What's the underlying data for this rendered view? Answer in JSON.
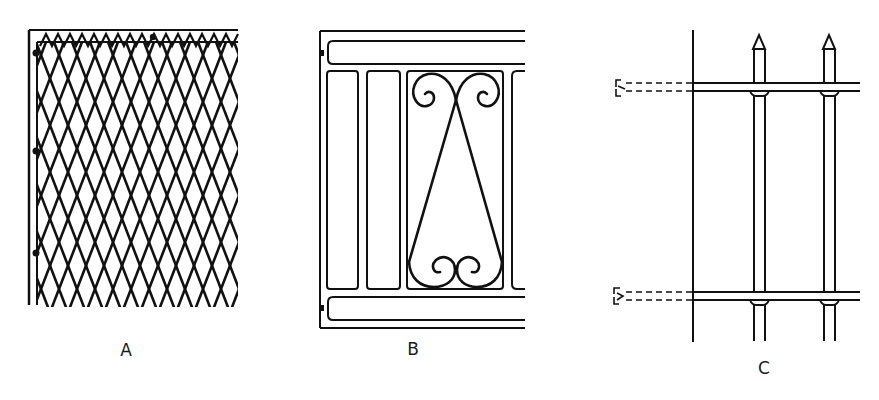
{
  "figure": {
    "panels": [
      {
        "id": "A",
        "label": "A",
        "subject": "diamond-mesh-fence"
      },
      {
        "id": "B",
        "label": "B",
        "subject": "ornamental-scroll-grille"
      },
      {
        "id": "C",
        "label": "C",
        "subject": "spear-top-railing"
      }
    ],
    "line_color": "#111111",
    "background_color": "#ffffff"
  }
}
